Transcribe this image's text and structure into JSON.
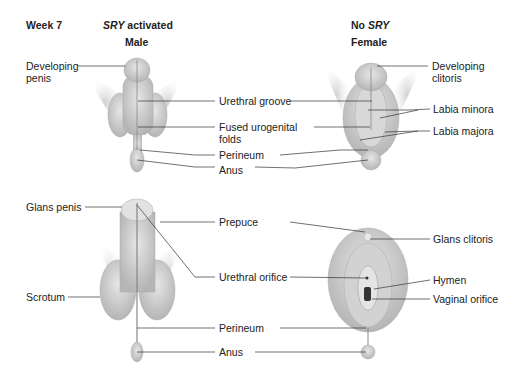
{
  "header": {
    "week": "Week 7",
    "male_gene_italic": "SRY",
    "male_gene_rest": " activated",
    "male_title": "Male",
    "female_gene_prefix": "No ",
    "female_gene_italic": "SRY",
    "female_title": "Female"
  },
  "top_labels": {
    "developing_penis_1": "Developing",
    "developing_penis_2": "penis",
    "urethral_groove": "Urethral groove",
    "fused_folds_1": "Fused urogenital",
    "fused_folds_2": "folds",
    "perineum": "Perineum",
    "anus": "Anus",
    "developing_clitoris_1": "Developing",
    "developing_clitoris_2": "clitoris",
    "labia_minora": "Labia minora",
    "labia_majora": "Labia majora"
  },
  "bottom_labels": {
    "glans_penis": "Glans penis",
    "scrotum": "Scrotum",
    "prepuce": "Prepuce",
    "urethral_orifice": "Urethral orifice",
    "perineum": "Perineum",
    "anus": "Anus",
    "glans_clitoris": "Glans clitoris",
    "hymen": "Hymen",
    "vaginal_orifice": "Vaginal orifice"
  }
}
